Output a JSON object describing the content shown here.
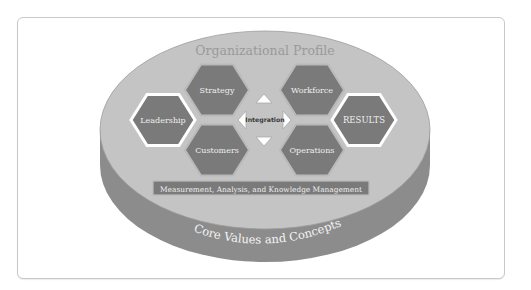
{
  "diagram": {
    "title": "Organizational Profile",
    "base_label": "Core Values and Concepts",
    "center_label": "Integration",
    "bar_label": "Measurement, Analysis, and Knowledge Management",
    "nodes": [
      {
        "id": "leadership",
        "label": "Leadership",
        "highlighted": true
      },
      {
        "id": "strategy",
        "label": "Strategy",
        "highlighted": false
      },
      {
        "id": "customers",
        "label": "Customers",
        "highlighted": false
      },
      {
        "id": "workforce",
        "label": "Workforce",
        "highlighted": false
      },
      {
        "id": "operations",
        "label": "Operations",
        "highlighted": false
      },
      {
        "id": "results",
        "label": "RESULTS",
        "highlighted": true
      }
    ],
    "arrows": [
      "up-arrow",
      "down-arrow",
      "left-arrow",
      "right-arrow"
    ],
    "colors": {
      "top_surface": "#c4c4c4",
      "side_surface": "#8c8c8c",
      "hexagon_fill": "#7a7a7a",
      "hexagon_border": "#b9b9b9",
      "highlight_border": "#ffffff",
      "title_text": "#9a9a9a",
      "label_text": "#efefef"
    }
  }
}
